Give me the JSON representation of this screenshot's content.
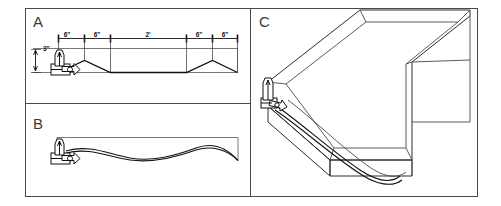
{
  "figure": {
    "background_color": "#ffffff",
    "line_color": "#4a4a4a",
    "profile_color": "#111111",
    "width": 501,
    "height": 206
  },
  "panels": [
    {
      "id": "A",
      "label": "A",
      "view": "front elevation with dimensions",
      "dimensions": [
        {
          "label": "6\"",
          "position": "top-left-1"
        },
        {
          "label": "6\"",
          "position": "top-left-2"
        },
        {
          "label": "2'",
          "position": "top-center"
        },
        {
          "label": "6\"",
          "position": "top-right-1"
        },
        {
          "label": "6\"",
          "position": "top-right-2"
        },
        {
          "label": "3\"",
          "position": "left-vertical"
        }
      ]
    },
    {
      "id": "B",
      "label": "B",
      "view": "side elevation with wave deflection profile",
      "dimensions": []
    },
    {
      "id": "C",
      "label": "C",
      "view": "isometric three-dimensional view",
      "dimensions": []
    }
  ],
  "annotations": {
    "fixture_name": "edge clamp fixture",
    "profile_name": "deformed panel profile"
  }
}
